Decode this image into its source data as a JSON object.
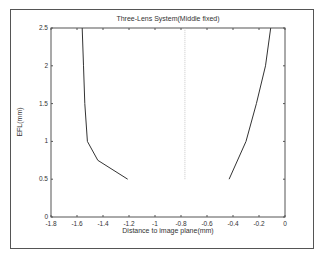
{
  "chart_data": {
    "type": "line",
    "title": "Three-Lens System(Middle fixed)",
    "xlabel": "Distance to image plane(mm)",
    "ylabel": "EFL(mm)",
    "xlim": [
      -1.8,
      0
    ],
    "ylim": [
      0,
      2.5
    ],
    "xticks": [
      "-1.8",
      "-1.6",
      "-1.4",
      "-1.2",
      "-1",
      "-0.8",
      "-0.6",
      "-0.4",
      "-0.2",
      "0"
    ],
    "yticks": [
      "0",
      "0.5",
      "1",
      "1.5",
      "2",
      "2.5"
    ],
    "grid": false,
    "legend": null,
    "series": [
      {
        "name": "left branch",
        "x": [
          -1.56,
          -1.55,
          -1.54,
          -1.52,
          -1.44,
          -1.21
        ],
        "y": [
          2.5,
          2.0,
          1.5,
          1.0,
          0.75,
          0.5
        ]
      },
      {
        "name": "right branch",
        "x": [
          -0.43,
          -0.3,
          -0.22,
          -0.15,
          -0.11
        ],
        "y": [
          0.5,
          1.0,
          1.5,
          2.0,
          2.5
        ]
      },
      {
        "name": "asymptote",
        "style": "dotted",
        "x": [
          -0.77,
          -0.77
        ],
        "y": [
          0.5,
          2.5
        ]
      }
    ]
  }
}
